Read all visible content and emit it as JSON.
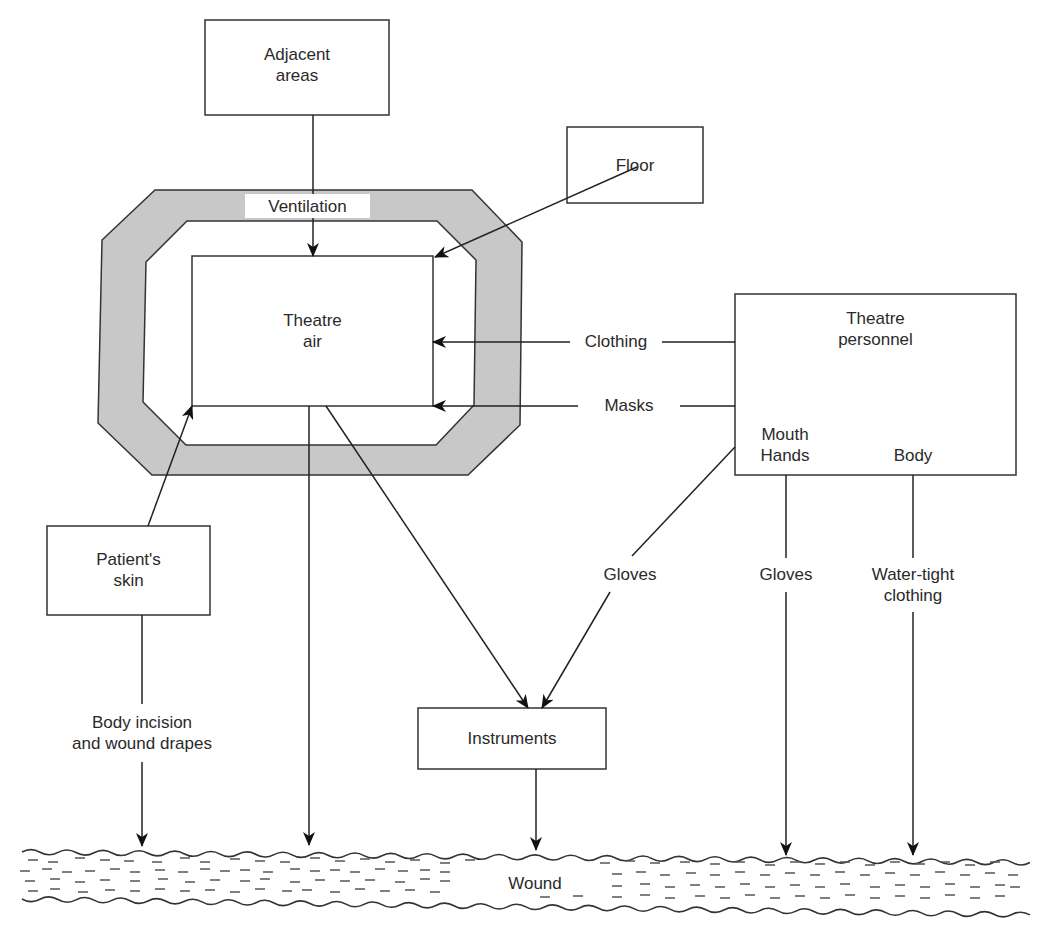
{
  "diagram": {
    "type": "flow",
    "colors": {
      "line": "#222222",
      "enclosure_fill": "#c8c8c8",
      "enclosure_stroke": "#333333",
      "text": "#2a2a2a",
      "background": "#ffffff"
    },
    "nodes": {
      "adjacent_areas": "Adjacent\nareas",
      "floor": "Floor",
      "theatre_air": "Theatre\nair",
      "theatre_personnel": "Theatre\npersonnel",
      "mouth_hands": "Mouth\nHands",
      "body": "Body",
      "patients_skin": "Patient's\nskin",
      "instruments": "Instruments",
      "wound": "Wound"
    },
    "edge_labels": {
      "ventilation": "Ventilation",
      "clothing": "Clothing",
      "masks": "Masks",
      "gloves_instruments": "Gloves",
      "gloves_wound": "Gloves",
      "water_tight_clothing": "Water-tight\nclothing",
      "body_incision": "Body incision\nand wound drapes"
    },
    "edges": [
      {
        "from": "Adjacent areas",
        "to": "Theatre air",
        "via": "Ventilation"
      },
      {
        "from": "Floor",
        "to": "Theatre air",
        "via": ""
      },
      {
        "from": "Theatre personnel",
        "to": "Theatre air",
        "via": "Clothing"
      },
      {
        "from": "Theatre personnel",
        "to": "Theatre air",
        "via": "Masks"
      },
      {
        "from": "Patient's skin",
        "to": "Theatre air",
        "via": ""
      },
      {
        "from": "Theatre air",
        "to": "Wound",
        "via": ""
      },
      {
        "from": "Theatre air",
        "to": "Instruments",
        "via": ""
      },
      {
        "from": "Mouth Hands",
        "to": "Instruments",
        "via": "Gloves"
      },
      {
        "from": "Instruments",
        "to": "Wound",
        "via": ""
      },
      {
        "from": "Patient's skin",
        "to": "Wound",
        "via": "Body incision and wound drapes"
      },
      {
        "from": "Mouth Hands",
        "to": "Wound",
        "via": "Gloves"
      },
      {
        "from": "Body",
        "to": "Wound",
        "via": "Water-tight clothing"
      }
    ]
  }
}
